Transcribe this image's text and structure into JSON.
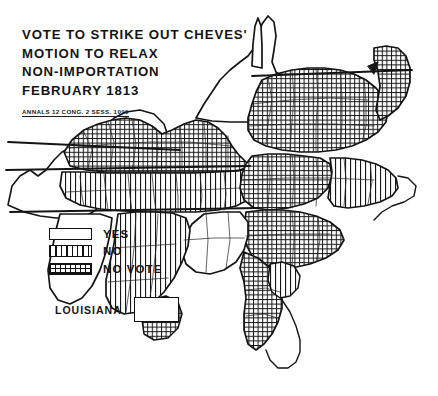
{
  "figure": {
    "kind": "historical-choropleth-map",
    "background_color": "#ffffff",
    "ink_color": "#141414"
  },
  "title": {
    "line1": "VOTE TO STRIKE OUT CHEVES'",
    "line2": "MOTION TO RELAX",
    "line3": "NON-IMPORTATION",
    "line4": "FEBRUARY 1813",
    "citation": "ANNALS 12 CONG. 2 SESS. 1099"
  },
  "legend": {
    "items": [
      {
        "label": "YES",
        "pattern": "blank",
        "swatch_class": "sw-yes"
      },
      {
        "label": "NO",
        "pattern": "vertical-lines",
        "swatch_class": "sw-no"
      },
      {
        "label": "NO VOTE",
        "pattern": "cross-hatch-grid",
        "swatch_class": "sw-novote"
      }
    ]
  },
  "inset": {
    "label": "LOUISIANA",
    "pattern": "blank",
    "meaning": "YES"
  },
  "map_data": {
    "type": "choropleth",
    "region": "Southeastern and Mid-Atlantic United States, 1813",
    "categories": [
      "YES",
      "NO",
      "NO VOTE"
    ],
    "patterns": {
      "YES": "blank",
      "NO": "vertical-lines",
      "NO VOTE": "cross-hatch-grid"
    },
    "areas": [
      {
        "name": "Missouri Territory",
        "value": "YES"
      },
      {
        "name": "Illinois Territory",
        "value": "YES"
      },
      {
        "name": "Indiana Territory",
        "value": "YES"
      },
      {
        "name": "Ohio",
        "value": "NO VOTE"
      },
      {
        "name": "Kentucky",
        "value": "NO VOTE"
      },
      {
        "name": "Tennessee",
        "value": "NO"
      },
      {
        "name": "Mississippi Territory",
        "value": "NO"
      },
      {
        "name": "Georgia",
        "value": "NO VOTE"
      },
      {
        "name": "South Carolina",
        "value": "NO VOTE"
      },
      {
        "name": "North Carolina",
        "value": "NO VOTE"
      },
      {
        "name": "Virginia",
        "value": "NO VOTE"
      },
      {
        "name": "Maryland",
        "value": "NO VOTE"
      },
      {
        "name": "Delaware",
        "value": "NO VOTE"
      },
      {
        "name": "Louisiana",
        "value": "YES"
      }
    ]
  }
}
